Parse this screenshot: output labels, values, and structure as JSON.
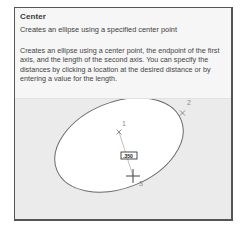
{
  "tooltip": {
    "title": "Center",
    "subtitle": "Creates an ellipse using a specified center point",
    "description": "Creates an ellipse using a center point, the endpoint of the first axis, and the length of the second axis. You can specify the distances by clicking a location at the desired distance or by entering a value for the length.",
    "illustration": {
      "points": [
        {
          "label": "1",
          "role": "center point",
          "marker": "x"
        },
        {
          "label": "2",
          "role": "first axis endpoint",
          "marker": "x"
        },
        {
          "label": "3",
          "role": "second axis length",
          "marker": "crosshair"
        }
      ],
      "dimension_value": ".350"
    }
  }
}
